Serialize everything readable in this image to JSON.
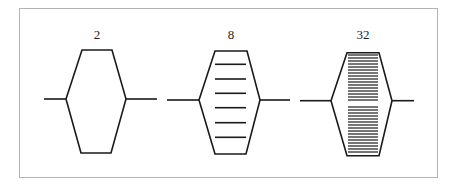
{
  "diagram": {
    "stroke_color": "#1a1a1a",
    "frame_color": "#b4b4b4",
    "shapes": [
      {
        "label": "2",
        "inner_lines": 0
      },
      {
        "label": "8",
        "inner_lines": 6
      },
      {
        "label": "32",
        "inner_lines": 32
      }
    ]
  }
}
